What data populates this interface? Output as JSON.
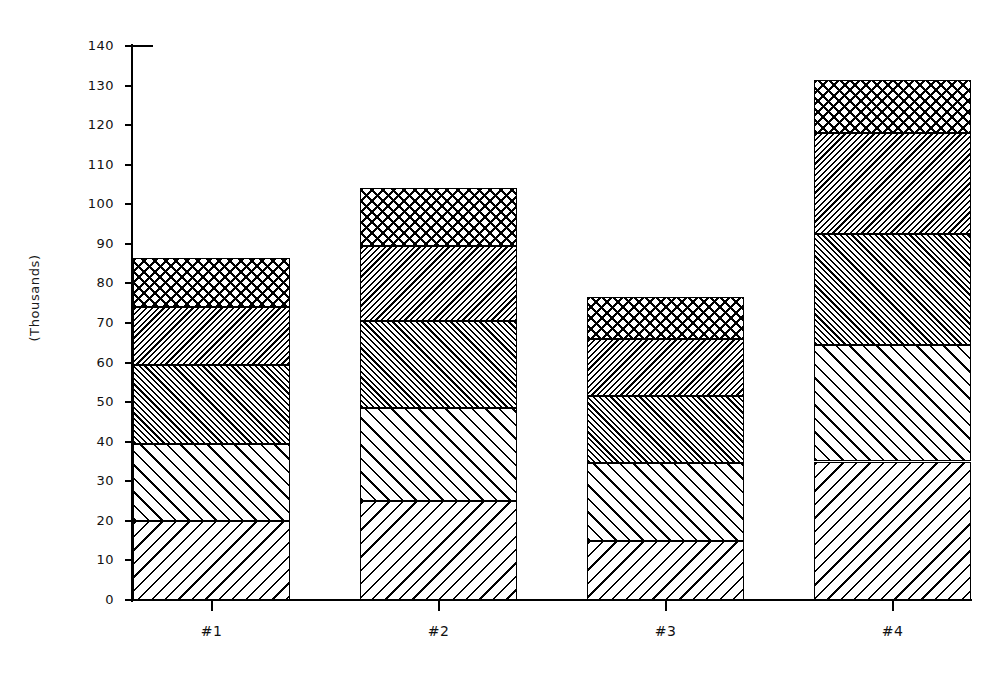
{
  "chart_data": {
    "type": "bar",
    "subtype": "stacked",
    "title": "",
    "xlabel": "",
    "ylabel": "(Thousands)",
    "categories": [
      "#1",
      "#2",
      "#3",
      "#4"
    ],
    "ylim": [
      0,
      140
    ],
    "y_ticks": [
      0,
      10,
      20,
      30,
      40,
      50,
      60,
      70,
      80,
      90,
      100,
      110,
      120,
      130,
      140
    ],
    "y_tick_labels": [
      "0",
      "10",
      "20",
      "30",
      "40",
      "50",
      "60",
      "70",
      "80",
      "90",
      "100",
      "110",
      "120",
      "130",
      "140"
    ],
    "grid": false,
    "legend": "none",
    "series": [
      {
        "name": "Series 1",
        "pattern": "diagonal-hatch-wide-down",
        "values": [
          20,
          25,
          15,
          35
        ]
      },
      {
        "name": "Series 2",
        "pattern": "diagonal-hatch-wide-up",
        "values": [
          19.5,
          23.5,
          19.5,
          29.5
        ]
      },
      {
        "name": "Series 3",
        "pattern": "diagonal-hatch-dense-up",
        "values": [
          20,
          22,
          17,
          28
        ]
      },
      {
        "name": "Series 4",
        "pattern": "diagonal-hatch-dense-down",
        "values": [
          14.5,
          19,
          14.5,
          25.5
        ]
      },
      {
        "name": "Series 5",
        "pattern": "cross-hatch",
        "values": [
          12.5,
          14.5,
          10.5,
          13.5
        ]
      }
    ],
    "totals": [
      86.5,
      104,
      76.5,
      131.5
    ],
    "cumulative_boundaries": [
      [
        20,
        39.5,
        59.5,
        74,
        86.5
      ],
      [
        25,
        48.5,
        70.5,
        89.5,
        104
      ],
      [
        15,
        34.5,
        51.5,
        66,
        76.5
      ],
      [
        35,
        64.5,
        92.5,
        118,
        131.5
      ]
    ]
  },
  "axis": {
    "y_title": "(Thousands)"
  }
}
